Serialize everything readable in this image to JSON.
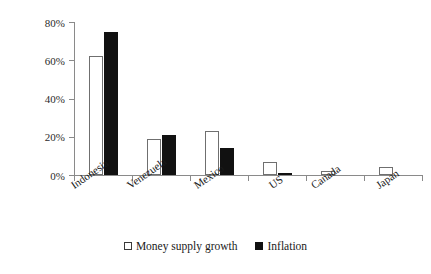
{
  "chart_data": {
    "type": "bar",
    "title": "",
    "subtitle": "",
    "xlabel": "",
    "ylabel": "",
    "ylim": [
      0,
      80
    ],
    "grid": false,
    "legend_position": "bottom-center",
    "ytick_labels": [
      "0%",
      "20%",
      "40%",
      "60%",
      "80%"
    ],
    "ytick_values": [
      0,
      20,
      40,
      60,
      80
    ],
    "categories": [
      "Indonesia",
      "Venezuela",
      "Mexico",
      "US",
      "Canada",
      "Japan"
    ],
    "series": [
      {
        "name": "Money supply growth",
        "color": "#ffffff",
        "values": [
          62,
          19,
          23,
          7,
          2,
          4
        ]
      },
      {
        "name": "Inflation",
        "color": "#111111",
        "values": [
          75,
          21,
          14,
          1,
          0,
          0
        ]
      }
    ]
  },
  "legend": {
    "entries": [
      {
        "label": "Money supply growth",
        "swatch": "hollow-square"
      },
      {
        "label": "Inflation",
        "swatch": "filled-square"
      }
    ]
  }
}
